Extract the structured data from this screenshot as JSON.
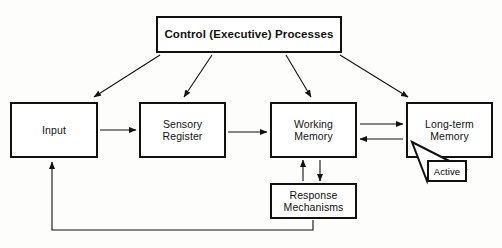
{
  "diagram": {
    "background_color": "#fdfdfc",
    "line_color": "#111111",
    "box_fill": "#ffffff",
    "nodes": [
      {
        "id": "control",
        "label": "Control (Executive) Processes",
        "x": 156,
        "y": 16,
        "w": 186,
        "h": 37
      },
      {
        "id": "input",
        "label": "Input",
        "x": 10,
        "y": 102,
        "w": 88,
        "h": 56
      },
      {
        "id": "sensory",
        "label": "Sensory\nRegister",
        "x": 139,
        "y": 102,
        "w": 87,
        "h": 56
      },
      {
        "id": "working",
        "label": "Working\nMemory",
        "x": 270,
        "y": 102,
        "w": 87,
        "h": 56
      },
      {
        "id": "ltm",
        "label": "Long-term\nMemory",
        "x": 406,
        "y": 102,
        "w": 87,
        "h": 56
      },
      {
        "id": "response",
        "label": "Response\nMechanisms",
        "x": 270,
        "y": 183,
        "w": 87,
        "h": 36
      },
      {
        "id": "active",
        "label": "Active",
        "x": 427,
        "y": 160,
        "w": 40,
        "h": 22
      }
    ],
    "edges": [
      {
        "id": "control-to-input",
        "from": "control",
        "to": "input",
        "style": "diagonal-arrow"
      },
      {
        "id": "control-to-sensory",
        "from": "control",
        "to": "sensory",
        "style": "diagonal-arrow"
      },
      {
        "id": "control-to-working",
        "from": "control",
        "to": "working",
        "style": "diagonal-arrow"
      },
      {
        "id": "control-to-ltm",
        "from": "control",
        "to": "ltm",
        "style": "diagonal-arrow"
      },
      {
        "id": "input-to-sensory",
        "from": "input",
        "to": "sensory",
        "style": "horizontal-arrow"
      },
      {
        "id": "sensory-to-working",
        "from": "sensory",
        "to": "working",
        "style": "horizontal-arrow"
      },
      {
        "id": "working-to-ltm",
        "from": "working",
        "to": "ltm",
        "style": "horizontal-arrow"
      },
      {
        "id": "ltm-to-working",
        "from": "ltm",
        "to": "working",
        "style": "horizontal-arrow"
      },
      {
        "id": "working-to-response",
        "from": "working",
        "to": "response",
        "style": "vertical-arrow"
      },
      {
        "id": "response-to-working",
        "from": "response",
        "to": "working",
        "style": "vertical-arrow"
      },
      {
        "id": "response-to-input-feedback",
        "from": "response",
        "to": "input",
        "style": "elbow-arrow"
      }
    ],
    "callout": {
      "id": "active-callout",
      "label": "Active",
      "points_to": "ltm"
    }
  }
}
